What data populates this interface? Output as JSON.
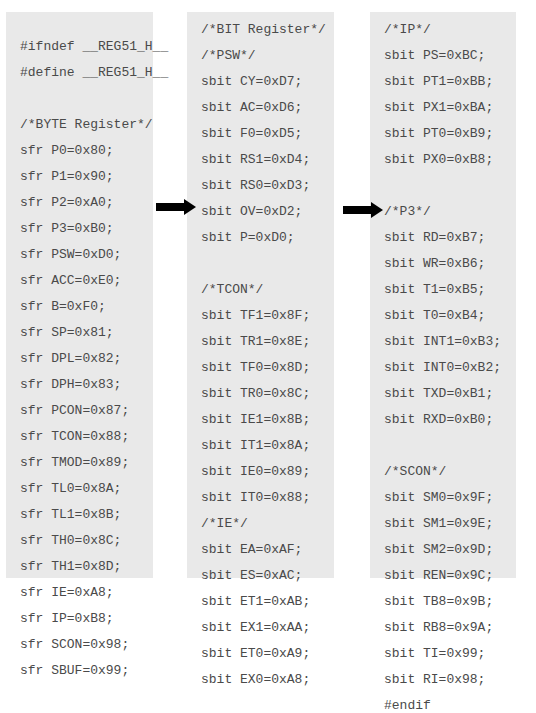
{
  "panels": {
    "left": {
      "lines": [
        "#ifndef __REG51_H__",
        "#define __REG51_H__",
        "",
        "/*BYTE Register*/",
        "sfr P0=0x80;",
        "sfr P1=0x90;",
        "sfr P2=0xA0;",
        "sfr P3=0xB0;",
        "sfr PSW=0xD0;",
        "sfr ACC=0xE0;",
        "sfr B=0xF0;",
        "sfr SP=0x81;",
        "sfr DPL=0x82;",
        "sfr DPH=0x83;",
        "sfr PCON=0x87;",
        "sfr TCON=0x88;",
        "sfr TMOD=0x89;",
        "sfr TL0=0x8A;",
        "sfr TL1=0x8B;",
        "sfr TH0=0x8C;",
        "sfr TH1=0x8D;",
        "sfr IE=0xA8;",
        "sfr IP=0xB8;",
        "sfr SCON=0x98;",
        "sfr SBUF=0x99;"
      ]
    },
    "middle": {
      "lines": [
        "/*BIT Register*/",
        "/*PSW*/",
        "sbit CY=0xD7;",
        "sbit AC=0xD6;",
        "sbit F0=0xD5;",
        "sbit RS1=0xD4;",
        "sbit RS0=0xD3;",
        "sbit OV=0xD2;",
        "sbit P=0xD0;",
        "",
        "/*TCON*/",
        "sbit TF1=0x8F;",
        "sbit TR1=0x8E;",
        "sbit TF0=0x8D;",
        "sbit TR0=0x8C;",
        "sbit IE1=0x8B;",
        "sbit IT1=0x8A;",
        "sbit IE0=0x89;",
        "sbit IT0=0x88;",
        "/*IE*/",
        "sbit EA=0xAF;",
        "sbit ES=0xAC;",
        "sbit ET1=0xAB;",
        "sbit EX1=0xAA;",
        "sbit ET0=0xA9;",
        "sbit EX0=0xA8;"
      ]
    },
    "right": {
      "lines": [
        "/*IP*/",
        "sbit PS=0xBC;",
        "sbit PT1=0xBB;",
        "sbit PX1=0xBA;",
        "sbit PT0=0xB9;",
        "sbit PX0=0xB8;",
        "",
        "/*P3*/",
        "sbit RD=0xB7;",
        "sbit WR=0xB6;",
        "sbit T1=0xB5;",
        "sbit T0=0xB4;",
        "sbit INT1=0xB3;",
        "sbit INT0=0xB2;",
        "sbit TXD=0xB1;",
        "sbit RXD=0xB0;",
        "",
        "/*SCON*/",
        "sbit SM0=0x9F;",
        "sbit SM1=0x9E;",
        "sbit SM2=0x9D;",
        "sbit REN=0x9C;",
        "sbit TB8=0x9B;",
        "sbit RB8=0x9A;",
        "sbit TI=0x99;",
        "sbit RI=0x98;",
        "#endif"
      ]
    }
  },
  "arrows": [
    {
      "icon": "right-arrow-icon",
      "from": "left",
      "to": "middle"
    },
    {
      "icon": "right-arrow-icon",
      "from": "middle",
      "to": "right"
    }
  ],
  "colors": {
    "panel_bg": "#e9e9e9",
    "text": "#4a4a4a",
    "arrow": "#000000"
  }
}
